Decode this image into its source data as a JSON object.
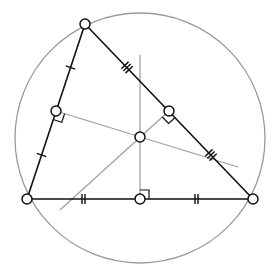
{
  "diagram": {
    "colors": {
      "background": "#ffffff",
      "triangle": "#111111",
      "circumcircle": "#9a9a9a",
      "bisector": "#a0a0a0",
      "point_fill": "#ffffff",
      "point_stroke": "#111111"
    },
    "circumcircle": {
      "cx": 140,
      "cy": 138,
      "r": 125
    },
    "vertices": [
      {
        "name": "top",
        "x": 85,
        "y": 24
      },
      {
        "name": "bottom-left",
        "x": 27,
        "y": 199
      },
      {
        "name": "bottom-right",
        "x": 253,
        "y": 199
      }
    ],
    "midpoints": [
      {
        "name": "left-side",
        "x": 56,
        "y": 111,
        "tick_count": 1
      },
      {
        "name": "right-side",
        "x": 169,
        "y": 111,
        "tick_count": 3
      },
      {
        "name": "bottom-side",
        "x": 140,
        "y": 199,
        "tick_count": 2
      }
    ],
    "circumcenter": {
      "x": 140,
      "y": 137
    },
    "bisectors": [
      {
        "name": "bisector-bottom",
        "x1": 140,
        "y1": 55,
        "x2": 140,
        "y2": 199
      },
      {
        "name": "bisector-left",
        "x1": 56,
        "y1": 111,
        "x2": 238,
        "y2": 167
      },
      {
        "name": "bisector-right",
        "x1": 169,
        "y1": 111,
        "x2": 60,
        "y2": 210
      }
    ],
    "point_radius": 5
  }
}
